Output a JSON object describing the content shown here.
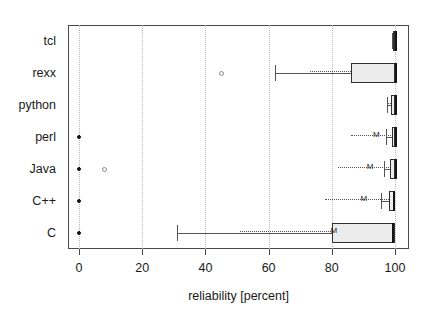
{
  "chart_data": {
    "type": "box",
    "title": "",
    "xlabel": "reliability [percent]",
    "ylabel": "",
    "xlim": [
      -4,
      104
    ],
    "xticks": [
      0,
      20,
      40,
      60,
      80,
      100
    ],
    "xtick_labels": [
      "0",
      "20",
      "40",
      "60",
      "80",
      "100"
    ],
    "grid": "vertical-dotted",
    "legend": "none",
    "categories": [
      "tcl",
      "rexx",
      "python",
      "perl",
      "Java",
      "C++",
      "C"
    ],
    "mean_marker_label": "M",
    "series": [
      {
        "name": "tcl",
        "whisker_low": 99.0,
        "q1": 99.3,
        "median": 100.0,
        "q3": 100.0,
        "whisker_high": 100.0,
        "mean": 99.6,
        "mean_line_from": 99.0,
        "show_mean_marker": false,
        "outliers": []
      },
      {
        "name": "rexx",
        "whisker_low": 62.0,
        "q1": 86.0,
        "median": 100.0,
        "q3": 100.0,
        "whisker_high": 100.0,
        "mean": 86.5,
        "mean_line_from": 73.0,
        "show_mean_marker": false,
        "outliers": [
          45.0
        ]
      },
      {
        "name": "python",
        "whisker_low": 97.5,
        "q1": 98.8,
        "median": 100.0,
        "q3": 100.0,
        "whisker_high": 100.0,
        "mean": 99.0,
        "mean_line_from": 97.5,
        "show_mean_marker": false,
        "outliers": []
      },
      {
        "name": "perl",
        "whisker_low": 97.0,
        "q1": 99.0,
        "median": 100.0,
        "q3": 100.0,
        "whisker_high": 100.0,
        "mean": 94.0,
        "mean_line_from": 86.0,
        "show_mean_marker": true,
        "outliers": [
          0.0
        ]
      },
      {
        "name": "Java",
        "whisker_low": 96.5,
        "q1": 98.5,
        "median": 100.0,
        "q3": 100.0,
        "whisker_high": 100.0,
        "mean": 92.0,
        "mean_line_from": 82.0,
        "show_mean_marker": true,
        "outliers": [
          0.0,
          8.0
        ]
      },
      {
        "name": "C++",
        "whisker_low": 95.5,
        "q1": 98.0,
        "median": 99.5,
        "q3": 100.0,
        "whisker_high": 100.0,
        "mean": 90.0,
        "mean_line_from": 78.0,
        "show_mean_marker": true,
        "outliers": [
          0.0
        ]
      },
      {
        "name": "C",
        "whisker_low": 31.0,
        "q1": 80.0,
        "median": 99.0,
        "q3": 100.0,
        "whisker_high": 100.0,
        "mean": 80.5,
        "mean_line_from": 51.0,
        "show_mean_marker": true,
        "outliers": [
          0.0
        ]
      }
    ]
  },
  "colors": {
    "box_fill": "#ececed",
    "box_edge": "#303030",
    "whisker": "#555555",
    "grid": "#b9b9b9",
    "axis": "#4a4a4a",
    "text": "#1a1a1a",
    "outlier_solid": "#151515",
    "outlier_hollow": "#8a8a8a"
  }
}
